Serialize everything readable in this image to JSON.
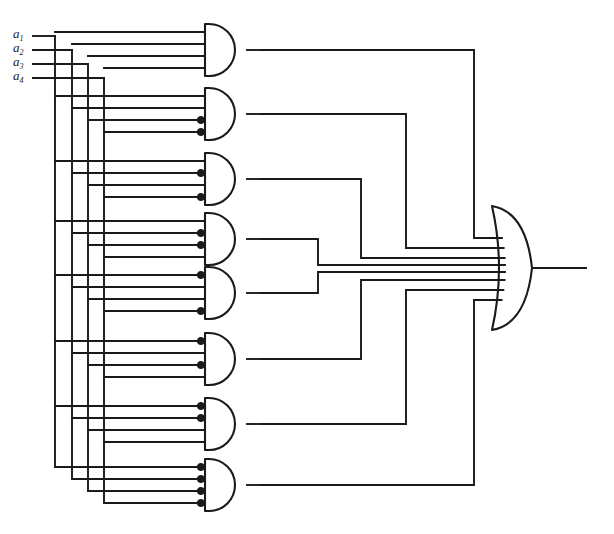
{
  "diagram": {
    "type": "logic-circuit-schematic",
    "stroke_color": "#1a1a1a",
    "background_color": "#ffffff",
    "inputs": [
      {
        "id": "a1",
        "label": "a",
        "subscript": "1",
        "y": 36
      },
      {
        "id": "a2",
        "label": "a",
        "subscript": "2",
        "y": 50
      },
      {
        "id": "a3",
        "label": "a",
        "subscript": "3",
        "y": 64
      },
      {
        "id": "a4",
        "label": "a",
        "subscript": "4",
        "y": 78
      }
    ],
    "bus": {
      "trunk_x": [
        55,
        72,
        88,
        104
      ],
      "entry_x": 33,
      "note": "Each input line runs right then drops on its own vertical trunk to feed every AND gate."
    },
    "and_gates": [
      {
        "id": "and-gate-1",
        "index": 1,
        "cy": 50,
        "inverted_inputs": [],
        "out_bus_x": 474
      },
      {
        "id": "and-gate-2",
        "index": 2,
        "cy": 114,
        "inverted_inputs": [
          3,
          4
        ],
        "out_bus_x": 406
      },
      {
        "id": "and-gate-3",
        "index": 3,
        "cy": 179,
        "inverted_inputs": [
          2,
          4
        ],
        "out_bus_x": 361
      },
      {
        "id": "and-gate-4",
        "index": 4,
        "cy": 239,
        "inverted_inputs": [
          2,
          3
        ],
        "out_bus_x": 318
      },
      {
        "id": "and-gate-5",
        "index": 5,
        "cy": 293,
        "inverted_inputs": [
          1,
          4
        ],
        "out_bus_x": 318
      },
      {
        "id": "and-gate-6",
        "index": 6,
        "cy": 359,
        "inverted_inputs": [
          1,
          3
        ],
        "out_bus_x": 361
      },
      {
        "id": "and-gate-7",
        "index": 7,
        "cy": 424,
        "inverted_inputs": [
          1,
          2
        ],
        "out_bus_x": 406
      },
      {
        "id": "and-gate-8",
        "index": 8,
        "cy": 485,
        "inverted_inputs": [
          1,
          2,
          3,
          4
        ],
        "out_bus_x": 474
      }
    ],
    "or_gate": {
      "id": "or-gate-1",
      "label": "OR",
      "cy": 268,
      "x_left": 492,
      "x_right": 532,
      "half_height": 62,
      "input_count": 8,
      "input_ys": [
        238,
        248,
        258,
        265,
        272,
        280,
        290,
        300
      ]
    },
    "output": {
      "id": "circuit-output",
      "y": 268,
      "x_start": 532,
      "x_end": 586
    },
    "gate_geometry": {
      "body_x_left": 205,
      "body_x_right": 247,
      "half_height": 26,
      "input_stub_x": 190,
      "bubble_radius": 3.6,
      "input_offsets": [
        -18,
        -6,
        6,
        18
      ]
    }
  }
}
